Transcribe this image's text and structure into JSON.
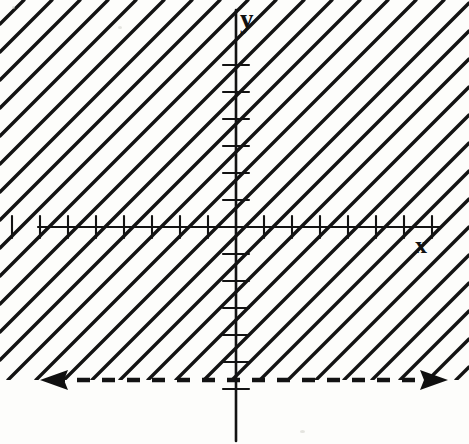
{
  "figure": {
    "kind": "coordinate-plane-inequality-graph",
    "width": 469,
    "height": 444,
    "background_color": "#fdfdfb",
    "ink_color": "#111111"
  },
  "axes": {
    "x_axis": {
      "label": "x",
      "label_x": 415,
      "label_y": 233,
      "y_position": 227,
      "x_start": 38,
      "x_end": 440,
      "stroke_width": 2.2
    },
    "y_axis": {
      "label": "y",
      "label_x": 240,
      "label_y": 6,
      "x_position": 236,
      "y_start": 10,
      "y_end": 441,
      "stroke_width": 2.6
    },
    "origin": {
      "x": 236,
      "y": 227
    }
  },
  "ticks": {
    "x_spacing": 28,
    "x_half_length": 11,
    "x_offsets": [
      -224,
      -196,
      -168,
      -140,
      -112,
      -84,
      -56,
      -28,
      28,
      56,
      84,
      112,
      140,
      168,
      196
    ],
    "y_spacing": 27,
    "y_half_length": 13,
    "y_offsets": [
      -162,
      -135,
      -108,
      -81,
      -54,
      -27,
      27,
      54,
      81,
      108,
      135,
      162
    ]
  },
  "boundary_line": {
    "style": "dashed",
    "y": 380,
    "x_start": 52,
    "x_end": 432,
    "dash_length": 13,
    "gap_length": 12,
    "stroke_width": 4.5,
    "left_arrow": {
      "tip_x": 40,
      "tip_y": 380,
      "direction": "left"
    },
    "right_arrow": {
      "tip_x": 448,
      "tip_y": 380,
      "direction": "right"
    }
  },
  "shading": {
    "description": "region above the dashed boundary line",
    "hatch_angle_deg": 45,
    "hatch_direction": "lower-left to upper-right",
    "hatch_spacing": 28,
    "stroke_width": 3.4,
    "clip_top": 0,
    "clip_bottom": 380
  },
  "chart_data": {
    "type": "line",
    "title": "",
    "xlabel": "x",
    "ylabel": "y",
    "grid": false,
    "legend": null,
    "xlim": [
      -8,
      8
    ],
    "ylim": [
      -6,
      8
    ],
    "annotations": [
      "Dashed horizontal boundary line with arrowheads on both ends",
      "Shaded (hatched) half-plane lies above the dashed line"
    ],
    "series": [
      {
        "name": "boundary",
        "kind": "horizontal-dashed-line",
        "y_value": -5.7,
        "x": [
          -8,
          8
        ],
        "values": [
          -5.7,
          -5.7
        ]
      }
    ],
    "shaded_region": {
      "relation": "greater-than",
      "inclusive": false,
      "side": "above"
    }
  }
}
